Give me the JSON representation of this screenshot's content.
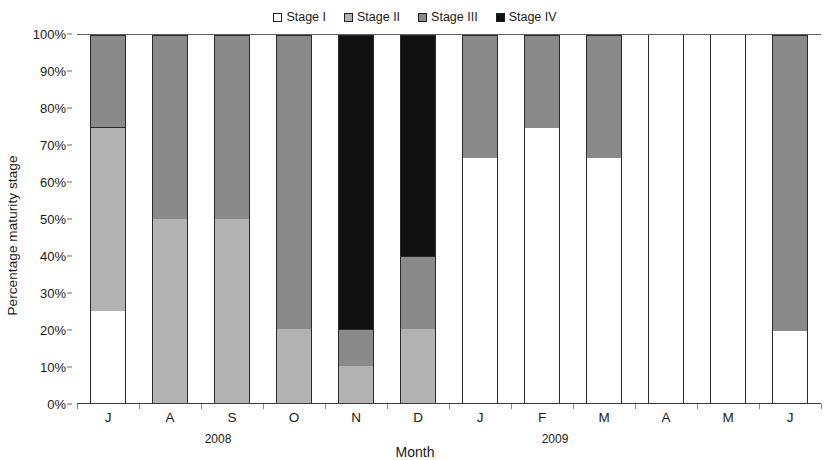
{
  "legend": {
    "position": "top-center",
    "entries": [
      {
        "label": "Stage I",
        "color": "#ffffff"
      },
      {
        "label": "Stage II",
        "color": "#b2b2b2"
      },
      {
        "label": "Stage III",
        "color": "#8a8a8a"
      },
      {
        "label": "Stage IV",
        "color": "#111111"
      }
    ]
  },
  "axes": {
    "y_title": "Percentage maturity stage",
    "x_title": "Month",
    "y_ticks": [
      "0%",
      "10%",
      "20%",
      "30%",
      "40%",
      "50%",
      "60%",
      "70%",
      "80%",
      "90%",
      "100%"
    ],
    "year_groups": [
      {
        "label": "2008"
      },
      {
        "label": "2009"
      }
    ]
  },
  "chart_data": {
    "type": "bar",
    "subtype": "stacked-percentage",
    "title": "",
    "xlabel": "Month",
    "ylabel": "Percentage maturity stage",
    "ylim": [
      0,
      100
    ],
    "ytick_step": 10,
    "grid": false,
    "legend_position": "top-center",
    "categories": [
      "J",
      "A",
      "S",
      "O",
      "N",
      "D",
      "J",
      "F",
      "M",
      "A",
      "M",
      "J"
    ],
    "category_years": [
      "2008",
      "2008",
      "2008",
      "2008",
      "2008",
      "2008",
      "2009",
      "2009",
      "2009",
      "2009",
      "2009",
      "2009"
    ],
    "series": [
      {
        "name": "Stage I",
        "color": "#ffffff",
        "values": [
          25,
          0,
          0,
          0,
          0,
          0,
          66.7,
          74.7,
          66.7,
          100,
          100,
          19.5
        ]
      },
      {
        "name": "Stage II",
        "color": "#b2b2b2",
        "values": [
          50,
          50,
          50,
          20,
          10,
          20,
          0,
          0,
          0,
          0,
          0,
          0
        ]
      },
      {
        "name": "Stage III",
        "color": "#8a8a8a",
        "values": [
          25,
          50,
          50,
          80,
          10,
          20,
          33.3,
          25.3,
          33.3,
          0,
          0,
          80.5
        ]
      },
      {
        "name": "Stage IV",
        "color": "#111111",
        "values": [
          0,
          0,
          0,
          0,
          80,
          60,
          0,
          0,
          0,
          0,
          0,
          0
        ]
      }
    ]
  }
}
